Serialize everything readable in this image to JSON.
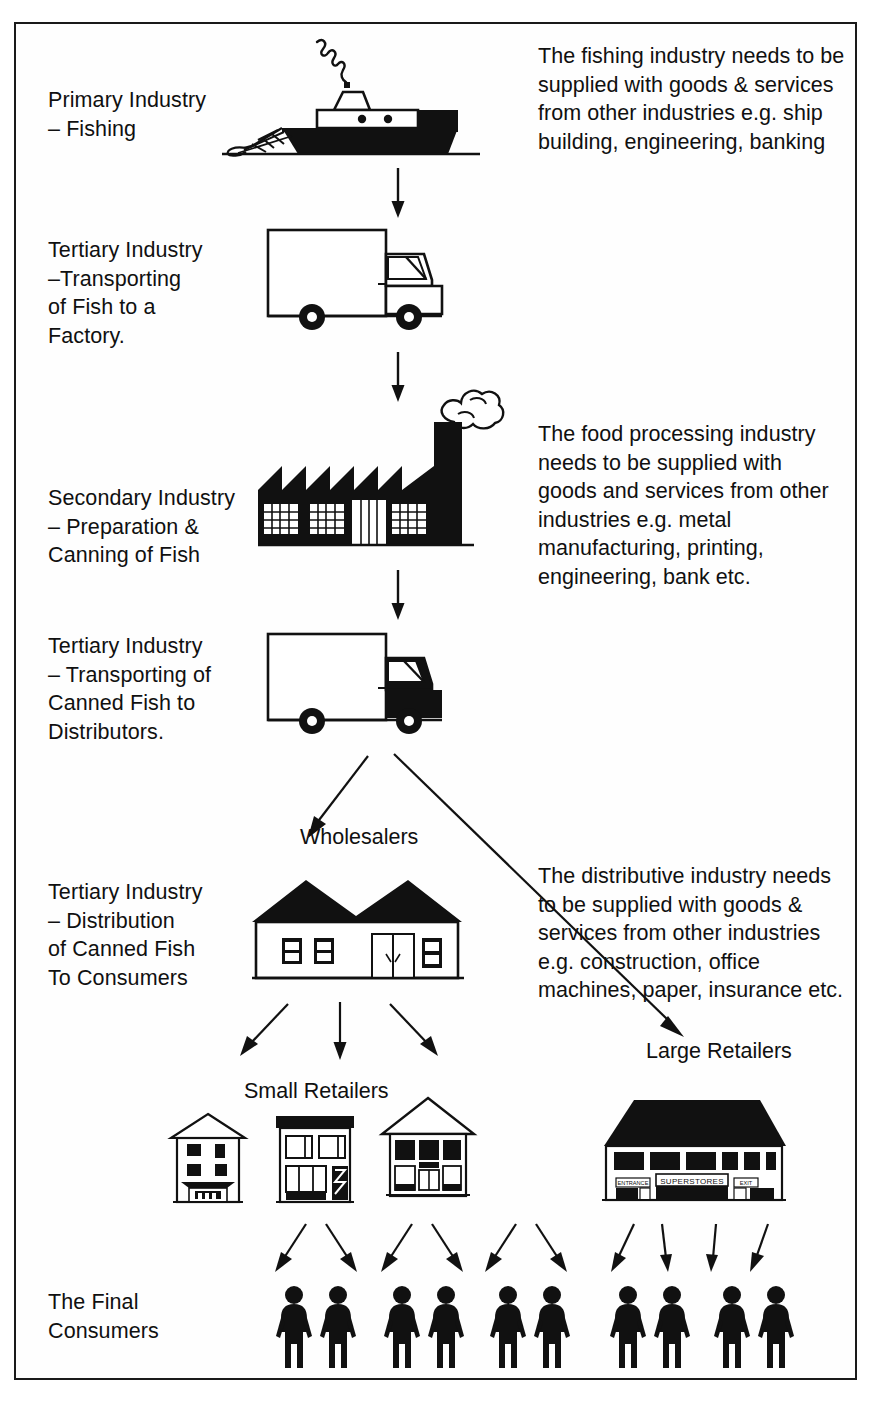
{
  "diagram": {
    "stages": [
      {
        "id": "primary-fishing",
        "label": "Primary Industry\n– Fishing",
        "icon": "fishing-boat-icon"
      },
      {
        "id": "tertiary-transport-fish",
        "label": "Tertiary Industry\n–Transporting\nof Fish to a\nFactory.",
        "icon": "delivery-truck-icon"
      },
      {
        "id": "secondary-canning",
        "label": "Secondary Industry\n– Preparation &\nCanning of Fish",
        "icon": "factory-icon"
      },
      {
        "id": "tertiary-transport-canned",
        "label": "Tertiary Industry\n– Transporting of\nCanned Fish to\nDistributors.",
        "icon": "delivery-truck-icon"
      },
      {
        "id": "tertiary-distribution",
        "label": "Tertiary Industry\n– Distribution\nof Canned Fish\nTo Consumers",
        "icon": "warehouse-icon"
      },
      {
        "id": "final-consumers",
        "label": "The Final\nConsumers",
        "icon": "people-icon"
      }
    ],
    "notes": [
      {
        "id": "note-fishing",
        "text": "The fishing industry needs to be\nsupplied with goods & services\nfrom other industries e.g. ship\nbuilding, engineering, banking"
      },
      {
        "id": "note-food-processing",
        "text": "The food processing industry\nneeds to be supplied with\ngoods and services from other\nindustries e.g. metal\nmanufacturing, printing,\nengineering, bank etc."
      },
      {
        "id": "note-distributive",
        "text": "The distributive industry needs\nto be supplied with goods &\nservices from other industries\ne.g. construction, office\nmachines, paper, insurance etc."
      }
    ],
    "captions": {
      "wholesalers": "Wholesalers",
      "small_retailers": "Small Retailers",
      "large_retailers": "Large Retailers"
    },
    "signage": {
      "superstores": "SUPERSTORES",
      "entrance": "ENTRANCE",
      "exit": "EXIT"
    },
    "counts": {
      "small_retailer_shops": 3,
      "large_retailer_shops": 1,
      "consumer_groups_small": 3,
      "consumer_groups_large": 2,
      "people_per_group": 2
    },
    "colors": {
      "ink": "#101010",
      "paper": "#ffffff",
      "border": "#1a1a1a"
    }
  }
}
